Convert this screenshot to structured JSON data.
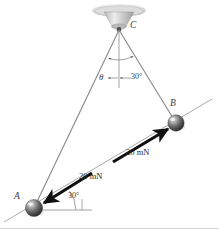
{
  "figure": {
    "kind": "statics-free-body-diagram",
    "background_color": "#ffffff",
    "ink_color": "#6b6b6b",
    "arrow_color": "#1a1a1a",
    "label_color": "#2b2b2b",
    "width": 219,
    "height": 234
  },
  "points": {
    "c": {
      "label": "C",
      "description": "ceiling-support-attachment",
      "x": 119,
      "y": 30
    },
    "b": {
      "label": "B",
      "description": "sphere-b",
      "x": 176,
      "y": 123
    },
    "a": {
      "label": "A",
      "description": "sphere-a",
      "x": 34,
      "y": 208
    }
  },
  "angles": {
    "theta": {
      "label": "θ",
      "description": "angle-between-cord-CA-and-vertical"
    },
    "thirty_at_c": {
      "label": "30°",
      "description": "angle-between-vertical-and-cord-CB"
    },
    "thirty_at_a": {
      "label": "30°",
      "description": "angle-of-force-at-A-above-horizontal"
    }
  },
  "forces": [
    {
      "label": "20 mN",
      "magnitude": 20,
      "unit": "mN",
      "applied_at": "B",
      "direction": "up-and-to-the-right-along-AB-line"
    },
    {
      "label": "20 mN",
      "magnitude": 20,
      "unit": "mN",
      "applied_at": "A",
      "direction": "down-and-to-the-left-along-AB-line"
    }
  ],
  "members": [
    {
      "name": "cord-CA",
      "from": "C",
      "to": "A"
    },
    {
      "name": "cord-CB",
      "from": "C",
      "to": "B"
    },
    {
      "name": "vertical-reference",
      "from": "C",
      "to": "below-C"
    }
  ]
}
